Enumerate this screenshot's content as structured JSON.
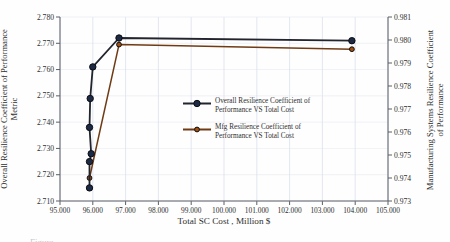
{
  "figure": {
    "caption_fragment": "Figure"
  },
  "chart_data": {
    "type": "line",
    "title": "",
    "xlabel": "Total SC Cost , Million $",
    "ylabel_left_line1": "Overall Resilience Coefficient of Performance",
    "ylabel_left_line2": "Metric",
    "ylabel_right_line1": "Manufacturing Systems Resilience Coefficient",
    "ylabel_right_line2": "of Performance",
    "x_range": [
      95,
      105
    ],
    "y_left_range": [
      2.71,
      2.78
    ],
    "y_right_range": [
      0.973,
      0.981
    ],
    "x_ticks": [
      "95.000",
      "96.000",
      "97.000",
      "98.000",
      "99.000",
      "100.000",
      "101.000",
      "102.000",
      "103.000",
      "104.000",
      "105.000"
    ],
    "y_left_ticks": [
      "2.710",
      "2.720",
      "2.730",
      "2.740",
      "2.750",
      "2.760",
      "2.770",
      "2.780"
    ],
    "y_right_ticks": [
      "0.973",
      "0.974",
      "0.975",
      "0.976",
      "0.977",
      "0.978",
      "0.979",
      "0.980",
      "0.981"
    ],
    "grid": true,
    "legend_position": "center-right",
    "colors": {
      "grid": "#dbe1ec",
      "axis": "#5a5f66",
      "text": "#2e2e2e"
    },
    "series": [
      {
        "name": "Overall Resilience Coefficient of Performance VS Total Cost",
        "axis": "left",
        "color": "#23252e",
        "marker_color": "#1d2a45",
        "points": [
          [
            95.9,
            2.715
          ],
          [
            95.9,
            2.725
          ],
          [
            95.95,
            2.728
          ],
          [
            95.9,
            2.738
          ],
          [
            95.92,
            2.749
          ],
          [
            96.0,
            2.761
          ],
          [
            96.8,
            2.772
          ],
          [
            103.9,
            2.771
          ]
        ]
      },
      {
        "name": "Mfg Resilience Coefficient of Performance VS Total Cost",
        "axis": "right",
        "color": "#6f3b14",
        "marker_color": "#a3500f",
        "points": [
          [
            95.9,
            0.974
          ],
          [
            96.8,
            0.9798
          ],
          [
            103.9,
            0.9796
          ]
        ]
      }
    ]
  }
}
